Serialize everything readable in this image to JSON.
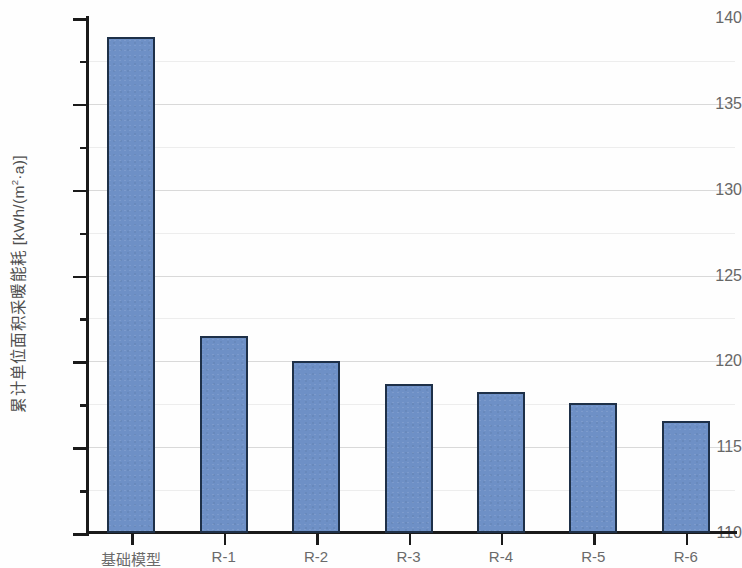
{
  "chart_data": {
    "type": "bar",
    "title": "",
    "subtitle": "",
    "xlabel": "",
    "ylabel": "累计单位面积采暖能耗 [kWh/(m²·a)]",
    "ylabel_parts": {
      "prefix": "累计单位面积采暖能耗 [kWh/(m",
      "superscript": "2",
      "suffix": "·a)]"
    },
    "categories": [
      "基础模型",
      "R-1",
      "R-2",
      "R-3",
      "R-4",
      "R-5",
      "R-6"
    ],
    "values": [
      138.9,
      121.5,
      120.0,
      118.7,
      118.2,
      117.6,
      116.5
    ],
    "ylim": [
      110,
      140
    ],
    "y_major_ticks": [
      110,
      115,
      120,
      125,
      130,
      135,
      140
    ],
    "y_major_tick_labels": [
      "110",
      "115",
      "120",
      "125",
      "130",
      "135",
      "140"
    ],
    "y_minor_ticks": [
      112.5,
      117.5,
      122.5,
      127.5,
      132.5,
      137.5
    ],
    "grid": "horizontal",
    "legend": "none",
    "series": [
      {
        "name": "累计单位面积采暖能耗",
        "values": [
          138.9,
          121.5,
          120.0,
          118.7,
          118.2,
          117.6,
          116.5
        ]
      }
    ],
    "colors": {
      "bar_fill": "#6e90c6",
      "bar_edge": "#1e3048",
      "grid_major": "#d9d9d9",
      "grid_minor": "#ededed",
      "axis": "#1a1a1a",
      "tick_text": "#676767",
      "axis_label_text": "#4f4f4f",
      "background": "#fefefe"
    }
  }
}
